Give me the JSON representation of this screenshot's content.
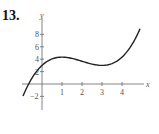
{
  "problem_number": "13.",
  "chart_data": {
    "type": "line",
    "title": "",
    "xlabel": "x",
    "ylabel": "y",
    "xlim": [
      -1,
      5
    ],
    "ylim": [
      -3,
      10
    ],
    "x_ticks": [
      1,
      2,
      3,
      4
    ],
    "y_ticks": [
      -2,
      2,
      4,
      6,
      8
    ],
    "grid": false,
    "series": [
      {
        "name": "f(x)",
        "x": [
          -1,
          -0.5,
          0,
          0.5,
          1,
          1.5,
          2,
          2.5,
          3,
          3.5,
          4,
          4.5,
          5
        ],
        "values": [
          -2.33,
          0,
          3,
          4.04,
          4.33,
          4.13,
          3.67,
          3.21,
          3.0,
          3.29,
          4.33,
          6.38,
          9.67
        ]
      }
    ]
  }
}
